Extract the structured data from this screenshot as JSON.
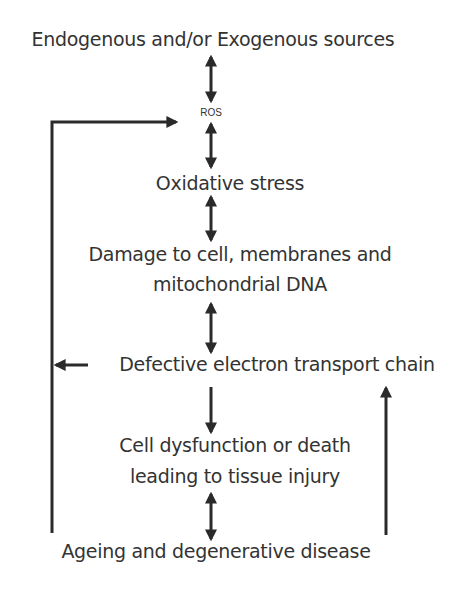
{
  "diagram": {
    "type": "flowchart",
    "nodes": [
      {
        "id": "sources",
        "label": "Endogenous and/or Exogenous sources"
      },
      {
        "id": "ros",
        "label": "ROS"
      },
      {
        "id": "oxidative_stress",
        "label": "Oxidative stress"
      },
      {
        "id": "damage",
        "label_line1": "Damage to cell, membranes and",
        "label_line2": "mitochondrial DNA"
      },
      {
        "id": "defective_etc",
        "label": "Defective electron transport chain"
      },
      {
        "id": "cell_dysfunction",
        "label_line1": "Cell dysfunction or death",
        "label_line2": "leading to tissue injury"
      },
      {
        "id": "ageing",
        "label": "Ageing and degenerative disease"
      }
    ],
    "edges": [
      {
        "from": "sources",
        "to": "ros",
        "direction": "bidirectional"
      },
      {
        "from": "ros",
        "to": "oxidative_stress",
        "direction": "bidirectional"
      },
      {
        "from": "oxidative_stress",
        "to": "damage",
        "direction": "bidirectional"
      },
      {
        "from": "damage",
        "to": "defective_etc",
        "direction": "bidirectional"
      },
      {
        "from": "defective_etc",
        "to": "cell_dysfunction",
        "direction": "forward"
      },
      {
        "from": "cell_dysfunction",
        "to": "ageing",
        "direction": "bidirectional"
      },
      {
        "from": "defective_etc",
        "to": "left_feedback_line",
        "direction": "forward"
      },
      {
        "from": "ageing",
        "to": "ros",
        "direction": "forward",
        "route": "left feedback loop"
      },
      {
        "from": "ageing",
        "to": "defective_etc",
        "direction": "forward",
        "route": "right feedback line"
      }
    ],
    "colors": {
      "text": "#333333",
      "arrow": "#2a2a2a",
      "background": "#ffffff"
    }
  }
}
